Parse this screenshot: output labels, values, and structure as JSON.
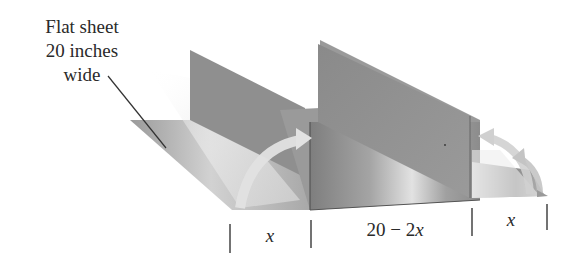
{
  "figure": {
    "callout": {
      "lines": [
        "Flat sheet",
        "20 inches",
        "wide"
      ]
    },
    "dimensions": [
      {
        "id": "left",
        "label": "x"
      },
      {
        "id": "middle",
        "label_number": "20 − 2",
        "label_var": "x"
      },
      {
        "id": "right",
        "label": "x"
      }
    ],
    "arrows": {
      "left_fold": "fold-up-arrow",
      "right_fold": "fold-up-arrow"
    },
    "colors": {
      "sheet_light": "#c8c8c8",
      "sheet_dark": "#8a8a8a",
      "panel_gray": "#8e8e8e",
      "arrow_light": "#e4e4e4",
      "line": "#333333",
      "background": "#ffffff"
    }
  }
}
